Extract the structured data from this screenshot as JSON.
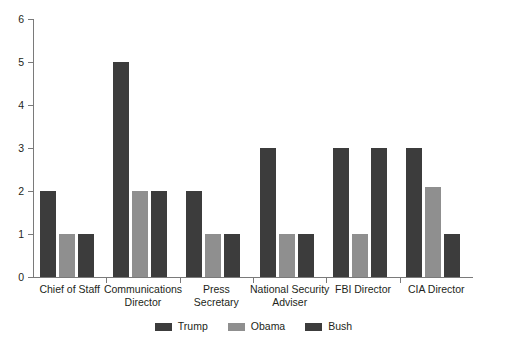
{
  "chart_data": {
    "type": "bar",
    "title": "",
    "subtitle": "",
    "xlabel": "",
    "ylabel": "",
    "ylim": [
      0,
      6
    ],
    "yticks": [
      0,
      1,
      2,
      3,
      4,
      5,
      6
    ],
    "grid": false,
    "legend_position": "bottom-center",
    "categories": [
      "Chief of Staff",
      "Communications\nDirector",
      "Press\nSecretary",
      "National Security\nAdviser",
      "FBI Director",
      "CIA Director"
    ],
    "series": [
      {
        "name": "Trump",
        "color": "#3c3c3c",
        "values": [
          2,
          5,
          2,
          3,
          3,
          3
        ]
      },
      {
        "name": "Obama",
        "color": "#8f8f8f",
        "values": [
          1,
          2,
          1,
          1,
          1,
          2.1
        ]
      },
      {
        "name": "Bush",
        "color": "#3c3c3c",
        "values": [
          1,
          2,
          1,
          1,
          3,
          1
        ]
      }
    ]
  },
  "axis": {
    "y_tick_labels": [
      "0",
      "1",
      "2",
      "3",
      "4",
      "5",
      "6"
    ],
    "axis_color": "#7a7a7a"
  },
  "legend": {
    "items": [
      {
        "label": "Trump",
        "color": "#3c3c3c"
      },
      {
        "label": "Obama",
        "color": "#8f8f8f"
      },
      {
        "label": "Bush",
        "color": "#3c3c3c"
      }
    ]
  }
}
